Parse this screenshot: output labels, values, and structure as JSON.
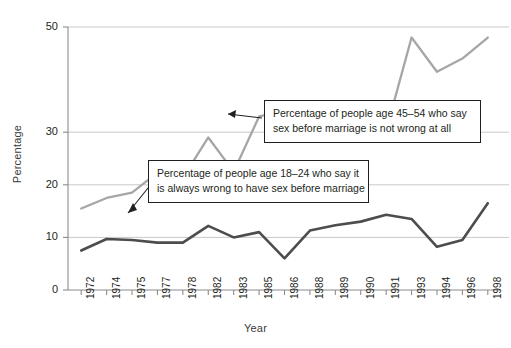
{
  "chart_data": {
    "type": "line",
    "title": "",
    "xlabel": "Year",
    "ylabel": "Percentage",
    "ylim": [
      0,
      50
    ],
    "ytick_labels": [
      "0",
      "10",
      "20",
      "30",
      "50"
    ],
    "ytick_values": [
      0,
      10,
      20,
      30,
      50
    ],
    "grid": "horizontal",
    "legend_position": "annotations-inline",
    "categories": [
      "1972",
      "1974",
      "1975",
      "1977",
      "1978",
      "1982",
      "1983",
      "1985",
      "1986",
      "1988",
      "1989",
      "1990",
      "1991",
      "1993",
      "1994",
      "1996",
      "1998"
    ],
    "series": [
      {
        "name": "Percentage of people age 45-54 who say sex before marriage is not wrong at all",
        "color": "#a6a6a6",
        "values": [
          15.5,
          17.5,
          18.5,
          22.3,
          21.3,
          29.0,
          22.5,
          33.0,
          34.0,
          30.0,
          33.0,
          30.5,
          30.3,
          48.0,
          41.5,
          44.0,
          48.0
        ]
      },
      {
        "name": "Percentage of people age 18-24 who say it is always wrong to have sex before marriage",
        "color": "#4d4d4d",
        "values": [
          7.5,
          9.7,
          9.5,
          9.0,
          9.0,
          12.2,
          10.0,
          11.0,
          6.0,
          11.3,
          12.3,
          13.0,
          14.3,
          13.5,
          8.2,
          9.5,
          16.5
        ]
      }
    ],
    "annotations": [
      {
        "id": "callout-45-54",
        "lines": [
          "Percentage of people age 45–54 who say",
          "sex before marriage is not wrong at all"
        ],
        "points_to": "1983"
      },
      {
        "id": "callout-18-24",
        "lines": [
          "Percentage of people age 18–24 who say it",
          "is always wrong to have sex before marriage"
        ],
        "points_to": "1975"
      }
    ]
  },
  "colors": {
    "series_light": "#a6a6a6",
    "series_dark": "#4d4d4d",
    "grid": "#c9c9c9",
    "axis": "#8c8c8c",
    "text": "#231f20"
  }
}
